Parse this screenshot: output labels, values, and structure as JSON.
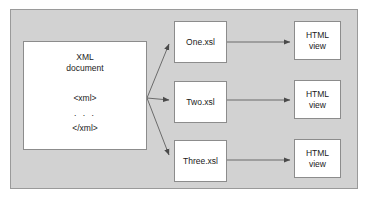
{
  "diagram": {
    "type": "xslt-transformation-flow",
    "panel": {
      "background_color": "#d2d2d2",
      "border_color": "#9a9a9a"
    },
    "node_style": {
      "fill_color": "#ffffff",
      "border_color": "#8c8c8c",
      "text_color": "#1a1a1a"
    },
    "connector_color": "#6b6b6b",
    "source": {
      "title_line1": "XML",
      "title_line2": "document",
      "code_line1": "<xml>",
      "code_line2": ". . .",
      "code_line3": "</xml>"
    },
    "stylesheets": [
      {
        "label": "One.xsl"
      },
      {
        "label": "Two.xsl"
      },
      {
        "label": "Three.xsl"
      }
    ],
    "outputs": [
      {
        "line1": "HTML",
        "line2": "view"
      },
      {
        "line1": "HTML",
        "line2": "view"
      },
      {
        "line1": "HTML",
        "line2": "view"
      }
    ]
  }
}
